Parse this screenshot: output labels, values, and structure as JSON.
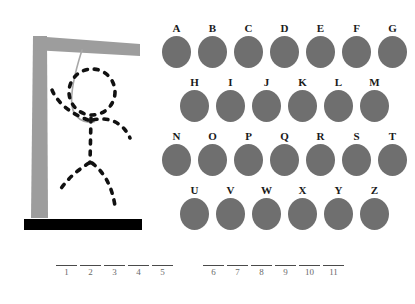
{
  "game": {
    "title": "Hangman",
    "gallows": {
      "post_color": "#9d9d9d",
      "beam_color": "#9d9d9d",
      "base_color": "#000000",
      "rope_color": "#a8a8a8",
      "figure_color": "#111111",
      "figure_style": "dashed",
      "parts_drawn": [
        "head",
        "body",
        "left-arm",
        "right-arm",
        "left-leg",
        "right-leg"
      ],
      "parts_drawn_count": 6
    },
    "letters": {
      "disc_color": "#6f6f6f",
      "label_color": "#1a1a1a",
      "rows": [
        {
          "row_index": 0,
          "indented": false,
          "keys": [
            "A",
            "B",
            "C",
            "D",
            "E",
            "F",
            "G"
          ]
        },
        {
          "row_index": 1,
          "indented": true,
          "keys": [
            "H",
            "I",
            "J",
            "K",
            "L",
            "M"
          ]
        },
        {
          "row_index": 2,
          "indented": false,
          "keys": [
            "N",
            "O",
            "P",
            "Q",
            "R",
            "S",
            "T"
          ]
        },
        {
          "row_index": 3,
          "indented": true,
          "keys": [
            "U",
            "V",
            "W",
            "X",
            "Y",
            "Z"
          ]
        }
      ]
    },
    "answer": {
      "total_blanks": 11,
      "groups": [
        {
          "group_index": 0,
          "numbers": [
            "1",
            "2",
            "3",
            "4",
            "5"
          ],
          "values": [
            "",
            "",
            "",
            "",
            ""
          ]
        },
        {
          "group_index": 1,
          "numbers": [
            "6",
            "7",
            "8",
            "9",
            "10",
            "11"
          ],
          "values": [
            "",
            "",
            "",
            "",
            "",
            ""
          ]
        }
      ]
    }
  }
}
